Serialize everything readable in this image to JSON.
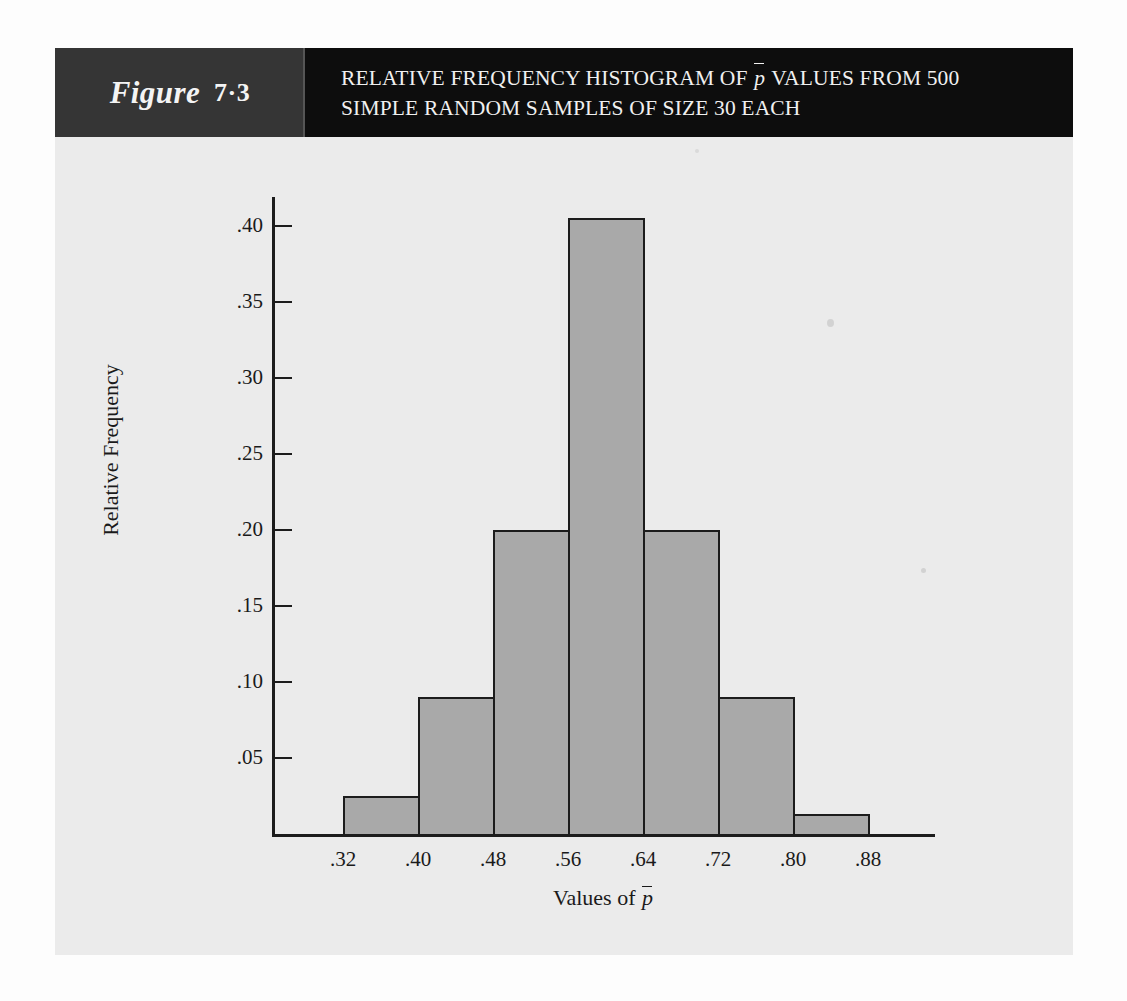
{
  "figure": {
    "label_word": "Figure",
    "number": "7·3",
    "title_line_1_before": "RELATIVE FREQUENCY HISTOGRAM OF ",
    "title_line_1_symbol": "p̄",
    "title_line_1_after": " VALUES FROM 500",
    "title_line_2": "SIMPLE RANDOM SAMPLES OF SIZE 30 EACH"
  },
  "colors": {
    "band_dark": "#0d0d0d",
    "band_figure_zone": "#353535",
    "panel_background": "#ebebeb",
    "bar_fill": "#a9a9a9",
    "bar_stroke": "#1c1c1c",
    "text_dark": "#1a1a1a",
    "text_light": "#f0f0f0"
  },
  "chart_data": {
    "type": "bar",
    "subtitle": "",
    "xlabel": "Values of p̄",
    "ylabel": "Relative Frequency",
    "grid": false,
    "legend": "none",
    "bin_edges": [
      0.32,
      0.4,
      0.48,
      0.56,
      0.64,
      0.72,
      0.8,
      0.88
    ],
    "bin_width": 0.08,
    "categories": [
      ".32-.40",
      ".40-.48",
      ".48-.56",
      ".56-.64",
      ".64-.72",
      ".72-.80",
      ".80-.88"
    ],
    "values": [
      0.025,
      0.09,
      0.2,
      0.405,
      0.2,
      0.09,
      0.013
    ],
    "xlim": [
      0.28,
      0.955
    ],
    "ylim": [
      0,
      0.42
    ],
    "xticks": [
      ".32",
      ".40",
      ".48",
      ".56",
      ".64",
      ".72",
      ".80",
      ".88"
    ],
    "xtick_values": [
      0.32,
      0.4,
      0.48,
      0.56,
      0.64,
      0.72,
      0.8,
      0.88
    ],
    "yticks": [
      ".05",
      ".10",
      ".15",
      ".20",
      ".25",
      ".30",
      ".35",
      ".40"
    ],
    "ytick_values": [
      0.05,
      0.1,
      0.15,
      0.2,
      0.25,
      0.3,
      0.35,
      0.4
    ],
    "sample_count": 500,
    "sample_size": 30
  }
}
